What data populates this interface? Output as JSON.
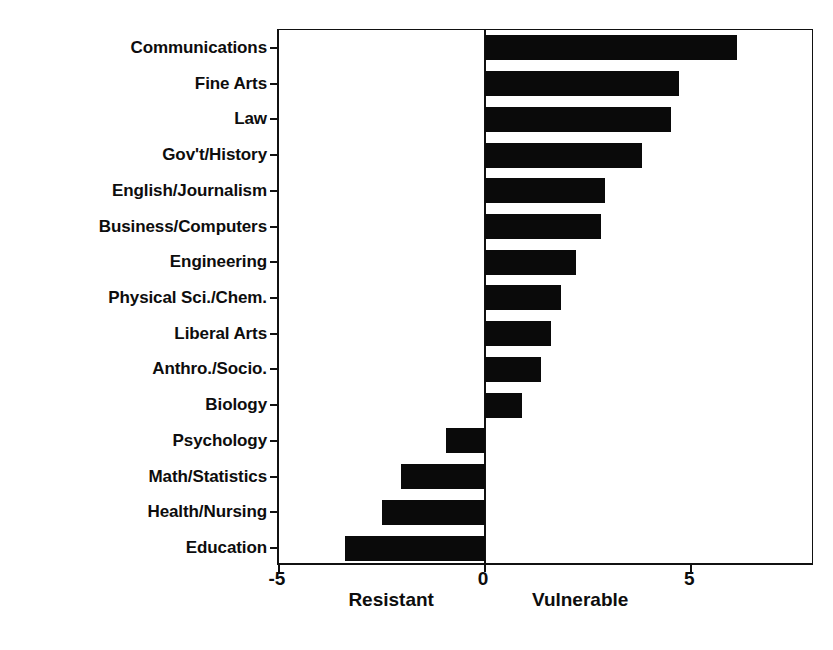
{
  "chart_data": {
    "type": "bar",
    "orientation": "horizontal",
    "title": "",
    "xlabel": "",
    "ylabel": "",
    "xlim": [
      -5,
      8
    ],
    "xticks": [
      -5,
      0,
      5
    ],
    "xtick_labels": [
      "-5",
      "0",
      "5"
    ],
    "grid": false,
    "legend": null,
    "bar_color": "#0a0a0a",
    "axis_color": "#111111",
    "background": "#ffffff",
    "zero_reference": 0,
    "direction_labels": {
      "negative": "Resistant",
      "positive": "Vulnerable"
    },
    "categories": [
      "Communications",
      "Fine Arts",
      "Law",
      "Gov't/History",
      "English/Journalism",
      "Business/Computers",
      "Engineering",
      "Physical Sci./Chem.",
      "Liberal Arts",
      "Anthro./Socio.",
      "Biology",
      "Psychology",
      "Math/Statistics",
      "Health/Nursing",
      "Education"
    ],
    "values": [
      6.1,
      4.7,
      4.5,
      3.8,
      2.9,
      2.8,
      2.2,
      1.85,
      1.6,
      1.35,
      0.9,
      -0.95,
      -2.05,
      -2.5,
      -3.4
    ]
  }
}
